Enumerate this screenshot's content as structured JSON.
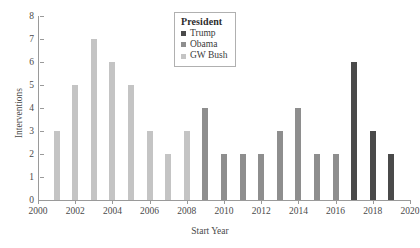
{
  "chart_data": {
    "type": "bar",
    "title": "",
    "xlabel": "Start Year",
    "ylabel": "Interventions",
    "xlim": [
      2000,
      2020
    ],
    "ylim": [
      0,
      8
    ],
    "grid": false,
    "legend_position": "top-center",
    "x": [
      2001,
      2002,
      2003,
      2004,
      2005,
      2006,
      2007,
      2008,
      2009,
      2010,
      2011,
      2012,
      2013,
      2014,
      2015,
      2016,
      2017,
      2018,
      2019
    ],
    "values": [
      3,
      5,
      7,
      6,
      5,
      3,
      2,
      4,
      2,
      2,
      2,
      3,
      4,
      2,
      2,
      6,
      3,
      2,
      2
    ],
    "x_tick_labels": [
      "2000",
      "2002",
      "2004",
      "2006",
      "2008",
      "2010",
      "2012",
      "2014",
      "2016",
      "2018",
      "2020"
    ],
    "x_tick_values": [
      2000,
      2002,
      2004,
      2006,
      2008,
      2010,
      2012,
      2014,
      2016,
      2018,
      2020
    ],
    "y_tick_labels": [
      "0",
      "1",
      "2",
      "3",
      "4",
      "5",
      "6",
      "7",
      "8"
    ],
    "y_tick_values": [
      0,
      1,
      2,
      3,
      4,
      5,
      6,
      7,
      8
    ],
    "series": [
      {
        "name": "Trump",
        "color": "#4a4a4a",
        "points": [
          {
            "x": 2017,
            "y": 6
          },
          {
            "x": 2018,
            "y": 3
          },
          {
            "x": 2019,
            "y": 2
          }
        ]
      },
      {
        "name": "Obama",
        "color": "#8e8e8e",
        "points": [
          {
            "x": 2009,
            "y": 2
          },
          {
            "x": 2010,
            "y": 2
          },
          {
            "x": 2011,
            "y": 2
          },
          {
            "x": 2012,
            "y": 3
          },
          {
            "x": 2013,
            "y": 4
          },
          {
            "x": 2014,
            "y": 2
          },
          {
            "x": 2015,
            "y": 2
          },
          {
            "x": 2016,
            "y": 4
          }
        ]
      },
      {
        "name": "GW Bush",
        "color": "#c4c4c4",
        "points": [
          {
            "x": 2001,
            "y": 3
          },
          {
            "x": 2002,
            "y": 5
          },
          {
            "x": 2003,
            "y": 7
          },
          {
            "x": 2004,
            "y": 6
          },
          {
            "x": 2005,
            "y": 5
          },
          {
            "x": 2006,
            "y": 3
          },
          {
            "x": 2007,
            "y": 2
          },
          {
            "x": 2008,
            "y": 3
          }
        ]
      }
    ],
    "bars": [
      {
        "x": 2001,
        "value": 3,
        "series": "GW Bush",
        "color": "#c4c4c4"
      },
      {
        "x": 2002,
        "value": 5,
        "series": "GW Bush",
        "color": "#c4c4c4"
      },
      {
        "x": 2003,
        "value": 7,
        "series": "GW Bush",
        "color": "#c4c4c4"
      },
      {
        "x": 2004,
        "value": 6,
        "series": "GW Bush",
        "color": "#c4c4c4"
      },
      {
        "x": 2005,
        "value": 5,
        "series": "GW Bush",
        "color": "#c4c4c4"
      },
      {
        "x": 2006,
        "value": 3,
        "series": "GW Bush",
        "color": "#c4c4c4"
      },
      {
        "x": 2007,
        "value": 2,
        "series": "GW Bush",
        "color": "#c4c4c4"
      },
      {
        "x": 2008,
        "value": 3,
        "series": "GW Bush",
        "color": "#c4c4c4"
      },
      {
        "x": 2009,
        "value": 4,
        "series": "Obama",
        "color": "#8e8e8e"
      },
      {
        "x": 2010,
        "value": 2,
        "series": "Obama",
        "color": "#8e8e8e"
      },
      {
        "x": 2011,
        "value": 2,
        "series": "Obama",
        "color": "#8e8e8e"
      },
      {
        "x": 2012,
        "value": 2,
        "series": "Obama",
        "color": "#8e8e8e"
      },
      {
        "x": 2013,
        "value": 3,
        "series": "Obama",
        "color": "#8e8e8e"
      },
      {
        "x": 2014,
        "value": 4,
        "series": "Obama",
        "color": "#8e8e8e"
      },
      {
        "x": 2015,
        "value": 2,
        "series": "Obama",
        "color": "#8e8e8e"
      },
      {
        "x": 2016,
        "value": 2,
        "series": "Obama",
        "color": "#8e8e8e"
      },
      {
        "x": 2017,
        "value": 6,
        "series": "Trump",
        "color": "#4a4a4a"
      },
      {
        "x": 2018,
        "value": 3,
        "series": "Trump",
        "color": "#4a4a4a"
      },
      {
        "x": 2019,
        "value": 2,
        "series": "Trump",
        "color": "#4a4a4a"
      }
    ]
  },
  "legend": {
    "title": "President",
    "entries": [
      {
        "label": "Trump",
        "color": "#4a4a4a"
      },
      {
        "label": "Obama",
        "color": "#8e8e8e"
      },
      {
        "label": "GW Bush",
        "color": "#c4c4c4"
      }
    ]
  },
  "axes": {
    "x_title": "Start Year",
    "y_title": "Interventions"
  }
}
